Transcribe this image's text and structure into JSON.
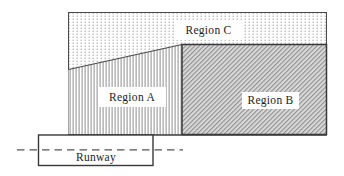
{
  "diagram": {
    "labels": {
      "region_a": "Region A",
      "region_b": "Region B",
      "region_c": "Region C",
      "runway": "Runway"
    },
    "patterns": {
      "region_a": "vertical-lines",
      "region_b": "diagonal-hatch",
      "region_c": "stipple-dots"
    },
    "colors": {
      "background": "#ffffff",
      "outline": "#4a4a4a",
      "dark_outline": "#383838",
      "pattern_line_gray": "#8f8f8f",
      "dot_gray": "#9a9a9a",
      "hatch_background": "#d9d9d9",
      "centerline": "#555555",
      "text": "#1c1c1c"
    }
  }
}
